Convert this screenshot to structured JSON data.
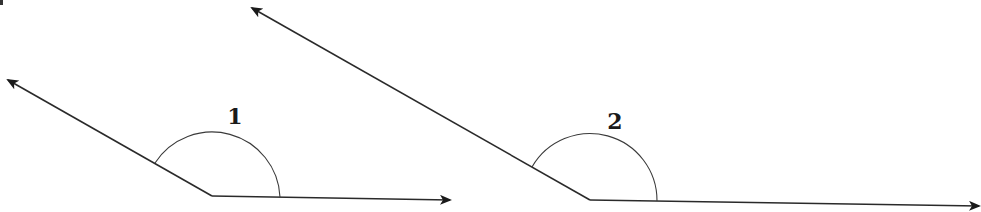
{
  "diagram": {
    "type": "angle-comparison",
    "colors": {
      "line": "#2a2a2a",
      "arc": "#3a3a3a",
      "label": "#1a1a1a",
      "background": "#ffffff"
    },
    "angles": [
      {
        "label": "1",
        "vertex": [
          212,
          196
        ],
        "ray_a_end": [
          8,
          80
        ],
        "ray_b_end": [
          450,
          200
        ],
        "arc": {
          "start": [
            155,
            162
          ],
          "end": [
            280,
            197
          ],
          "radius": 68
        },
        "label_pos": [
          235,
          124
        ]
      },
      {
        "label": "2",
        "vertex": [
          590,
          200
        ],
        "ray_a_end": [
          252,
          8
        ],
        "ray_b_end": [
          981,
          206
        ],
        "arc": {
          "start": [
            532,
            168
          ],
          "end": [
            657,
            200
          ],
          "radius": 67
        },
        "label_pos": [
          615,
          129
        ]
      }
    ]
  }
}
